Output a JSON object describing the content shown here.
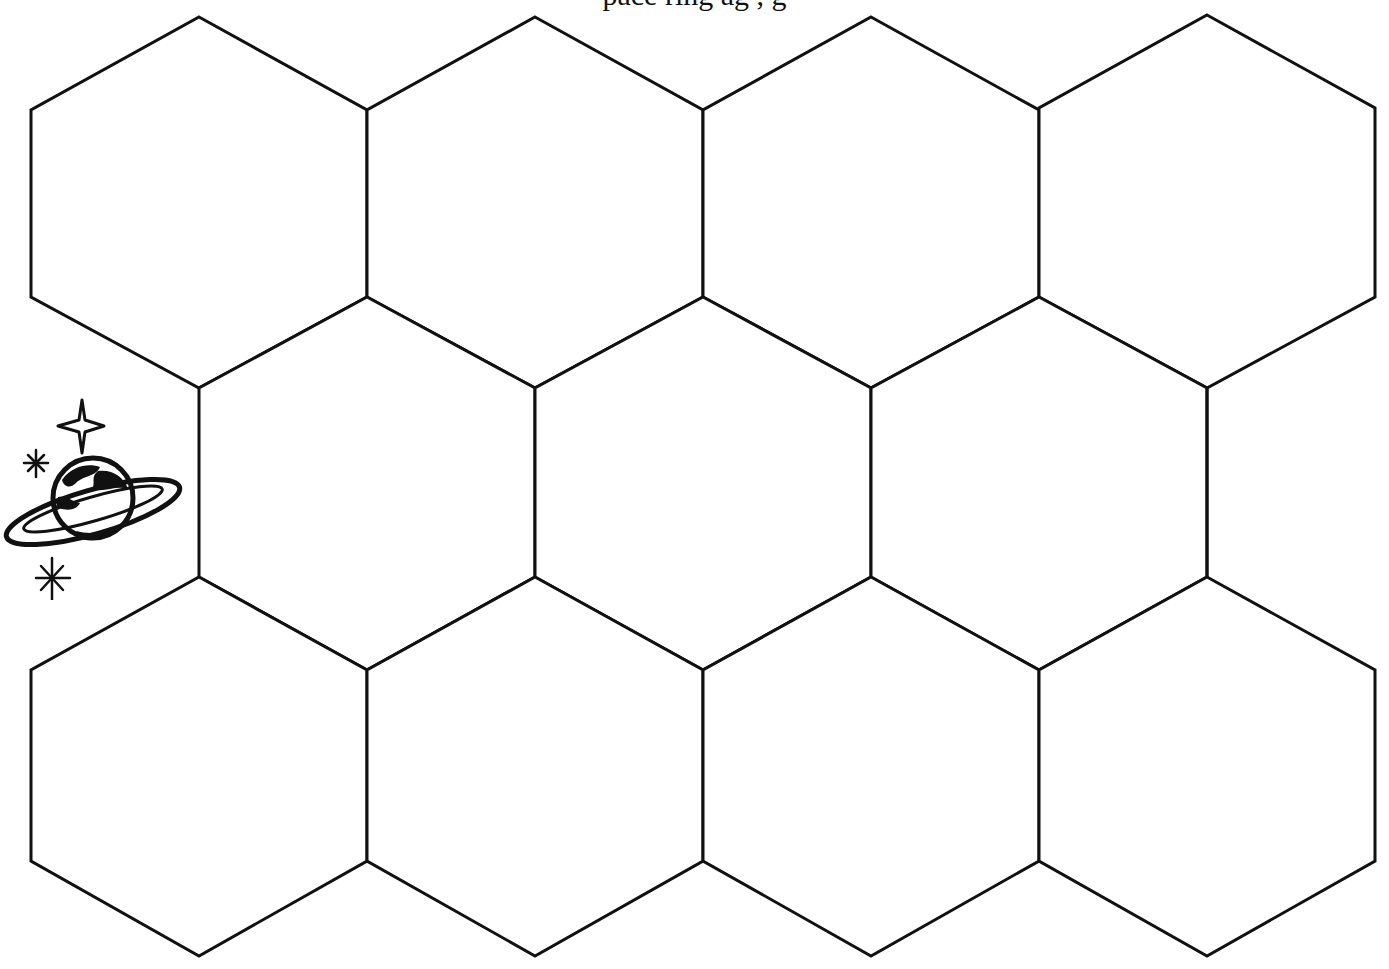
{
  "page": {
    "top_instruction_text": "pace ring                  ag  ,            g"
  },
  "board": {
    "type": "hexagonal-grid",
    "rows": 3,
    "columns_per_row": [
      4,
      3,
      4
    ],
    "cells": [
      {
        "row": 0,
        "col": 0,
        "label": ""
      },
      {
        "row": 0,
        "col": 1,
        "label": ""
      },
      {
        "row": 0,
        "col": 2,
        "label": ""
      },
      {
        "row": 0,
        "col": 3,
        "label": ""
      },
      {
        "row": 1,
        "col": 0,
        "label": ""
      },
      {
        "row": 1,
        "col": 1,
        "label": ""
      },
      {
        "row": 1,
        "col": 2,
        "label": ""
      },
      {
        "row": 2,
        "col": 0,
        "label": ""
      },
      {
        "row": 2,
        "col": 1,
        "label": ""
      },
      {
        "row": 2,
        "col": 2,
        "label": ""
      },
      {
        "row": 2,
        "col": 3,
        "label": ""
      }
    ],
    "stroke_color": "#111111",
    "fill_color": "#ffffff"
  },
  "decorations": {
    "start_marker": "ringed-planet-with-sparkles"
  }
}
